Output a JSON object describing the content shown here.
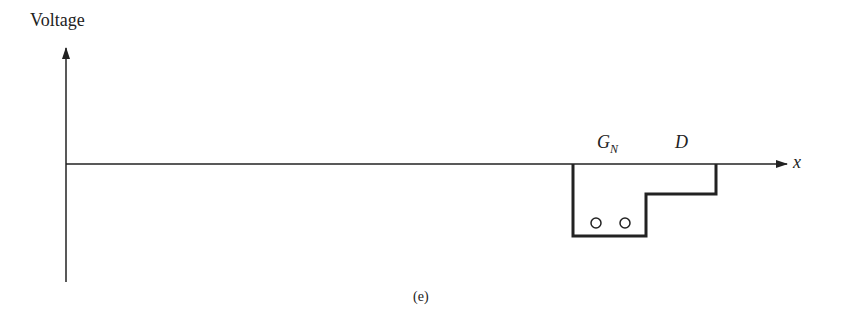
{
  "figure": {
    "y_axis_label": "Voltage",
    "x_axis_label": "x",
    "caption": "(e)",
    "region_labels": {
      "gate": "G",
      "gate_subscript": "N",
      "drain": "D"
    },
    "electrons": 2,
    "colors": {
      "line": "#222222",
      "background": "#ffffff"
    }
  }
}
